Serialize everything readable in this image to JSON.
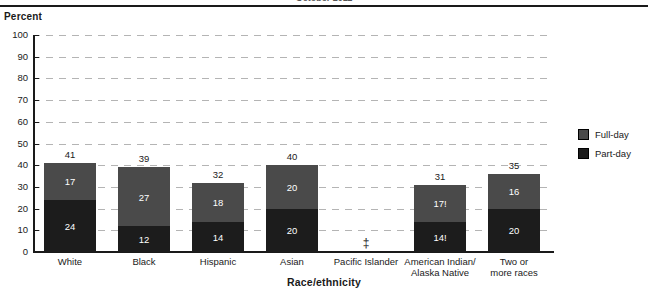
{
  "header": {
    "clipped_title": "October 2011"
  },
  "axis": {
    "y_title": "Percent",
    "x_title": "Race/ethnicity"
  },
  "legend": {
    "position": "right",
    "items": [
      {
        "label": "Full-day",
        "color": "#4a4a4a"
      },
      {
        "label": "Part-day",
        "color": "#1c1c1c"
      }
    ]
  },
  "chart_data": {
    "type": "bar",
    "stacked": true,
    "title": "",
    "xlabel": "Race/ethnicity",
    "ylabel": "Percent",
    "ylim": [
      0,
      100
    ],
    "yticks": [
      0,
      10,
      20,
      30,
      40,
      50,
      60,
      70,
      80,
      90,
      100
    ],
    "grid": true,
    "categories": [
      "White",
      "Black",
      "Hispanic",
      "Asian",
      "Pacific Islander",
      "American Indian/\nAlaska Native",
      "Two or\nmore races"
    ],
    "series": [
      {
        "name": "Part-day",
        "color": "#1c1c1c",
        "values": [
          24,
          12,
          14,
          20,
          null,
          14,
          20
        ],
        "labels": [
          "24",
          "12",
          "14",
          "20",
          "",
          "14!",
          "20"
        ]
      },
      {
        "name": "Full-day",
        "color": "#4a4a4a",
        "values": [
          17,
          27,
          18,
          20,
          null,
          17,
          16
        ],
        "labels": [
          "17",
          "27",
          "18",
          "20",
          "",
          "17!",
          "16"
        ]
      }
    ],
    "totals": [
      41,
      39,
      32,
      40,
      null,
      31,
      35
    ],
    "total_labels": [
      "41",
      "39",
      "32",
      "40",
      "‡",
      "31",
      "35"
    ]
  },
  "categories_display": [
    {
      "line1": "White",
      "line2": ""
    },
    {
      "line1": "Black",
      "line2": ""
    },
    {
      "line1": "Hispanic",
      "line2": ""
    },
    {
      "line1": "Asian",
      "line2": ""
    },
    {
      "line1": "Pacific Islander",
      "line2": ""
    },
    {
      "line1": "American Indian/",
      "line2": "Alaska Native"
    },
    {
      "line1": "Two or",
      "line2": "more races"
    }
  ]
}
